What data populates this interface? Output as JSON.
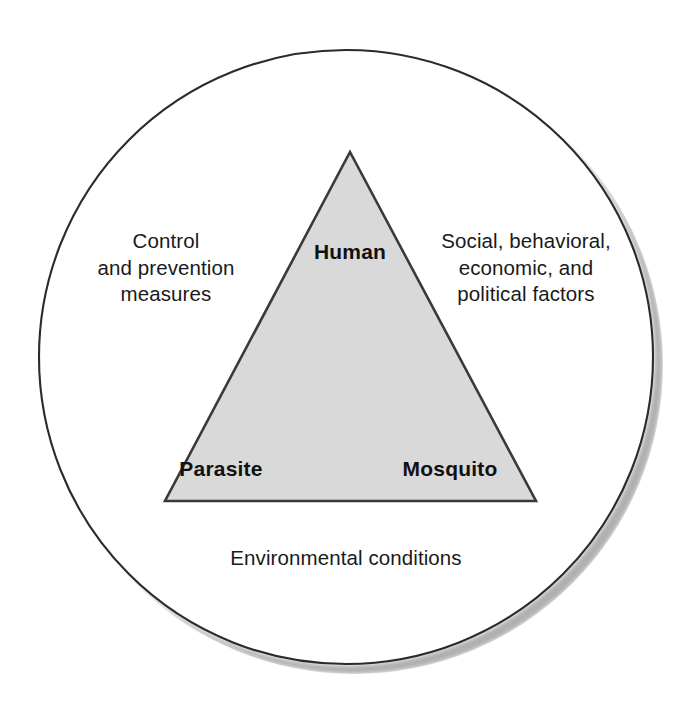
{
  "diagram": {
    "kind": "epidemiologic-triangle-in-circle",
    "outer_shape": {
      "name": "circle",
      "stroke_color": "#2b2b2b",
      "fill_color": "#ffffff",
      "shadow_color": "#b3b3b3"
    },
    "inner_shape": {
      "name": "triangle",
      "fill_color": "#d9d9d9",
      "stroke_color": "#3a3a3a"
    },
    "triangle_vertices": [
      {
        "id": "human",
        "label": "Human",
        "position": "apex"
      },
      {
        "id": "parasite",
        "label": "Parasite",
        "position": "bottom-left"
      },
      {
        "id": "mosquito",
        "label": "Mosquito",
        "position": "bottom-right"
      }
    ],
    "circle_labels": [
      {
        "id": "control-prevention",
        "text": "Control\nand prevention\nmeasures",
        "position": "left"
      },
      {
        "id": "social-factors",
        "text": "Social, behavioral,\neconomic, and\npolitical factors",
        "position": "right"
      },
      {
        "id": "environmental-conditions",
        "text": "Environmental conditions",
        "position": "bottom"
      }
    ]
  }
}
